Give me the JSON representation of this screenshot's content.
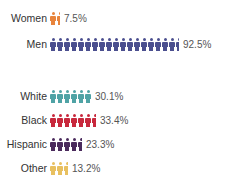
{
  "chart_data": [
    {
      "type": "bar",
      "subtype": "pictogram",
      "title": "",
      "categories": [
        "Women",
        "Men"
      ],
      "values": [
        7.5,
        92.5
      ],
      "value_labels": [
        "7.5%",
        "92.5%"
      ],
      "colors": [
        "#e8843c",
        "#4b4f8f"
      ],
      "unit": "%",
      "icon_scale_percent_per_icon": 5
    },
    {
      "type": "bar",
      "subtype": "pictogram",
      "title": "",
      "categories": [
        "White",
        "Black",
        "Hispanic",
        "Other"
      ],
      "values": [
        30.1,
        33.4,
        23.3,
        13.2
      ],
      "value_labels": [
        "30.1%",
        "33.4%",
        "23.3%",
        "13.2%"
      ],
      "colors": [
        "#4fa3a5",
        "#c8283c",
        "#4a2a5c",
        "#e8c060"
      ],
      "unit": "%",
      "icon_scale_percent_per_icon": 5
    }
  ],
  "rows": [
    {
      "label": "Women",
      "value": "7.5%",
      "pct": 7.5,
      "color": "#e8843c",
      "top": 10
    },
    {
      "label": "Men",
      "value": "92.5%",
      "pct": 92.5,
      "color": "#4b4f8f",
      "top": 36
    },
    {
      "label": "White",
      "value": "30.1%",
      "pct": 30.1,
      "color": "#4fa3a5",
      "top": 88
    },
    {
      "label": "Black",
      "value": "33.4%",
      "pct": 33.4,
      "color": "#c8283c",
      "top": 112
    },
    {
      "label": "Hispanic",
      "value": "23.3%",
      "pct": 23.3,
      "color": "#4a2a5c",
      "top": 136
    },
    {
      "label": "Other",
      "value": "13.2%",
      "pct": 13.2,
      "color": "#e8c060",
      "top": 160
    }
  ]
}
